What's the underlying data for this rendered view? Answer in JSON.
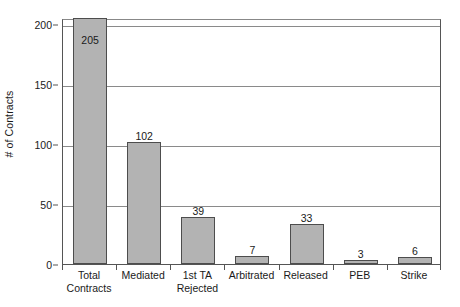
{
  "chart_data": {
    "type": "bar",
    "title": "",
    "subtitle": "",
    "xlabel": "",
    "ylabel": "# of Contracts",
    "ylim": [
      0,
      205
    ],
    "yticks": [
      0,
      50,
      100,
      150,
      200
    ],
    "ytick_labels": [
      "0",
      "50",
      "100",
      "150",
      "200"
    ],
    "grid": "horizontal",
    "legend": "none",
    "categories": [
      "Total Contracts",
      "Mediated",
      "1st TA Rejected",
      "Arbitrated",
      "Released",
      "PEB",
      "Strike"
    ],
    "category_lines": [
      [
        "Total",
        "Contracts"
      ],
      [
        "Mediated",
        ""
      ],
      [
        "1st TA",
        "Rejected"
      ],
      [
        "Arbitrated",
        ""
      ],
      [
        "Released",
        ""
      ],
      [
        "PEB",
        ""
      ],
      [
        "Strike",
        ""
      ]
    ],
    "values": [
      205,
      102,
      39,
      7,
      33,
      3,
      6
    ],
    "value_labels": [
      "205",
      "102",
      "39",
      "7",
      "33",
      "3",
      "6"
    ],
    "bar_color": "#b3b3b3",
    "bar_border_color": "#4d4d4d",
    "grid_color": "#8a8a8a",
    "axis_color": "#555555",
    "background_color": "#ffffff"
  }
}
